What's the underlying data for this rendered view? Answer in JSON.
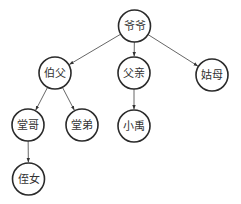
{
  "diagram": {
    "type": "family-tree",
    "colors": {
      "stroke": "#2a2a2a",
      "edge": "#555555",
      "text": "#333333",
      "background": "#ffffff"
    },
    "node_radius": 16,
    "nodes": [
      {
        "id": "yeye",
        "label": "爷爷",
        "cx": 134.5,
        "cy": 26
      },
      {
        "id": "bofu",
        "label": "伯父",
        "cx": 55,
        "cy": 73
      },
      {
        "id": "fuqin",
        "label": "父亲",
        "cx": 134,
        "cy": 73
      },
      {
        "id": "gumu",
        "label": "姑母",
        "cx": 212,
        "cy": 75
      },
      {
        "id": "tangge",
        "label": "堂哥",
        "cx": 28,
        "cy": 125
      },
      {
        "id": "tangdi",
        "label": "堂弟",
        "cx": 82,
        "cy": 125
      },
      {
        "id": "xiaoyu",
        "label": "小禹",
        "cx": 134,
        "cy": 126
      },
      {
        "id": "zhinv",
        "label": "侄女",
        "cx": 28.5,
        "cy": 179
      }
    ],
    "edges": [
      {
        "from": "yeye",
        "to": "bofu"
      },
      {
        "from": "yeye",
        "to": "fuqin"
      },
      {
        "from": "yeye",
        "to": "gumu"
      },
      {
        "from": "bofu",
        "to": "tangge"
      },
      {
        "from": "bofu",
        "to": "tangdi"
      },
      {
        "from": "fuqin",
        "to": "xiaoyu"
      },
      {
        "from": "tangge",
        "to": "zhinv"
      }
    ]
  }
}
